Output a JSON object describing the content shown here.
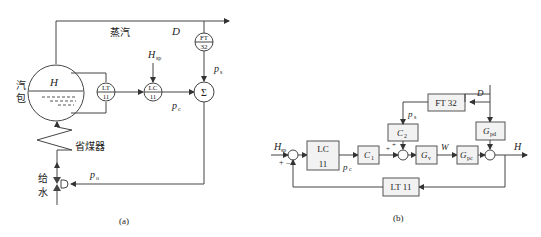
{
  "figure_a": {
    "caption": "(a)",
    "steam_label": "蒸汽",
    "steam_flow": "D",
    "drum_label_1": "汽",
    "drum_label_2": "包",
    "level": "H",
    "economizer": "省煤器",
    "feedwater_1": "给",
    "feedwater_2": "水",
    "lt_top": "LT",
    "lt_bot": "11",
    "lc_top": "LC",
    "lc_bot": "11",
    "ft_top": "FT",
    "ft_bot": "32",
    "setpoint_main": "H",
    "setpoint_sub": "sp",
    "sum_symbol": "Σ",
    "pc_main": "p",
    "pc_sub": "c",
    "ps_main": "p",
    "ps_sub": "s",
    "po_main": "p",
    "po_sub": "o"
  },
  "figure_b": {
    "caption": "(b)",
    "input_main": "H",
    "input_sub": "sp",
    "plus": "+",
    "minus": "−",
    "lc_top": "LC",
    "lc_bot": "11",
    "pc_main": "p",
    "pc_sub": "c",
    "c1_main": "C",
    "c1_sub": "1",
    "c2_main": "C",
    "c2_sub": "2",
    "gv_main": "G",
    "gv_sub": "v",
    "gpc_main": "G",
    "gpc_sub": "pc",
    "gpd_main": "G",
    "gpd_sub": "pd",
    "ft": "FT 32",
    "lt": "LT 11",
    "disturbance": "D",
    "ps_main": "p",
    "ps_sub": "s",
    "w": "W",
    "output": "H"
  }
}
